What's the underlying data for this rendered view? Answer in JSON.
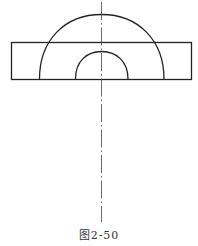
{
  "figure": {
    "caption": "图2-50",
    "stroke_color": "#222222",
    "elements": [
      "rectangle-plate",
      "outer-semicircle-arc",
      "inner-semicircle-arc",
      "vertical-centerline-dash-dot"
    ]
  }
}
